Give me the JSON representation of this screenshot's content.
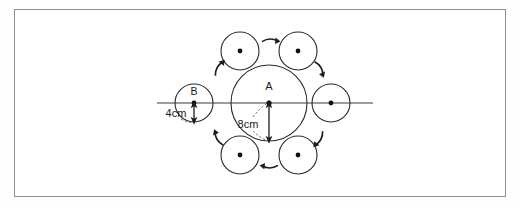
{
  "figure": {
    "type": "geometry-diagram",
    "background_color": "#ffffff",
    "frame": {
      "border_color": "#8e8e8e",
      "x": 14,
      "y": 9,
      "width": 492,
      "height": 188
    },
    "stroke_color": "#2b2b2b",
    "dot_color": "#111111",
    "labels": {
      "center_circle": "A",
      "left_circle": "B",
      "small_radius": "4cm",
      "large_radius": "8cm"
    },
    "axis_line": {
      "name": "horizontal-axis",
      "x1": 157,
      "y1": 103,
      "x2": 373,
      "y2": 103
    },
    "center_circle": {
      "label": "A",
      "cx": 269,
      "cy": 103,
      "r": 38,
      "radius_value": "8cm"
    },
    "surrounding_circles": [
      {
        "name": "circle-left",
        "label": "B",
        "cx": 194,
        "cy": 103,
        "r": 19,
        "angle_deg": 180
      },
      {
        "name": "circle-upper-left",
        "label": "",
        "cx": 240,
        "cy": 51,
        "r": 19,
        "angle_deg": 120
      },
      {
        "name": "circle-upper-right",
        "label": "",
        "cx": 298,
        "cy": 51,
        "r": 19,
        "angle_deg": 60
      },
      {
        "name": "circle-right",
        "label": "",
        "cx": 331,
        "cy": 103,
        "r": 19,
        "angle_deg": 0
      },
      {
        "name": "circle-lower-right",
        "label": "",
        "cx": 298,
        "cy": 155,
        "r": 19,
        "angle_deg": 300
      },
      {
        "name": "circle-lower-left",
        "label": "",
        "cx": 240,
        "cy": 155,
        "r": 19,
        "angle_deg": 240
      }
    ],
    "small_circle_radius_value": "4cm",
    "rotation_arrows": [
      {
        "name": "arrow-top",
        "x": 270,
        "y": 40,
        "rotation_deg": 0
      },
      {
        "name": "arrow-upper-right",
        "x": 320,
        "y": 68,
        "rotation_deg": 60
      },
      {
        "name": "arrow-lower-right",
        "x": 320,
        "y": 139,
        "rotation_deg": 120
      },
      {
        "name": "arrow-bottom",
        "x": 270,
        "y": 167,
        "rotation_deg": 180
      },
      {
        "name": "arrow-lower-left",
        "x": 218,
        "y": 139,
        "rotation_deg": 240
      },
      {
        "name": "arrow-upper-left",
        "x": 218,
        "y": 68,
        "rotation_deg": 300
      }
    ],
    "dimension_8cm": {
      "label": "8cm",
      "from_x": 269,
      "from_y": 103,
      "to_x": 269,
      "to_y": 141,
      "label_x": 248,
      "label_y": 129
    },
    "dimension_4cm": {
      "label": "4cm",
      "from_x": 194,
      "from_y": 103,
      "to_x": 194,
      "to_y": 122,
      "label_x": 172,
      "label_y": 117
    }
  }
}
